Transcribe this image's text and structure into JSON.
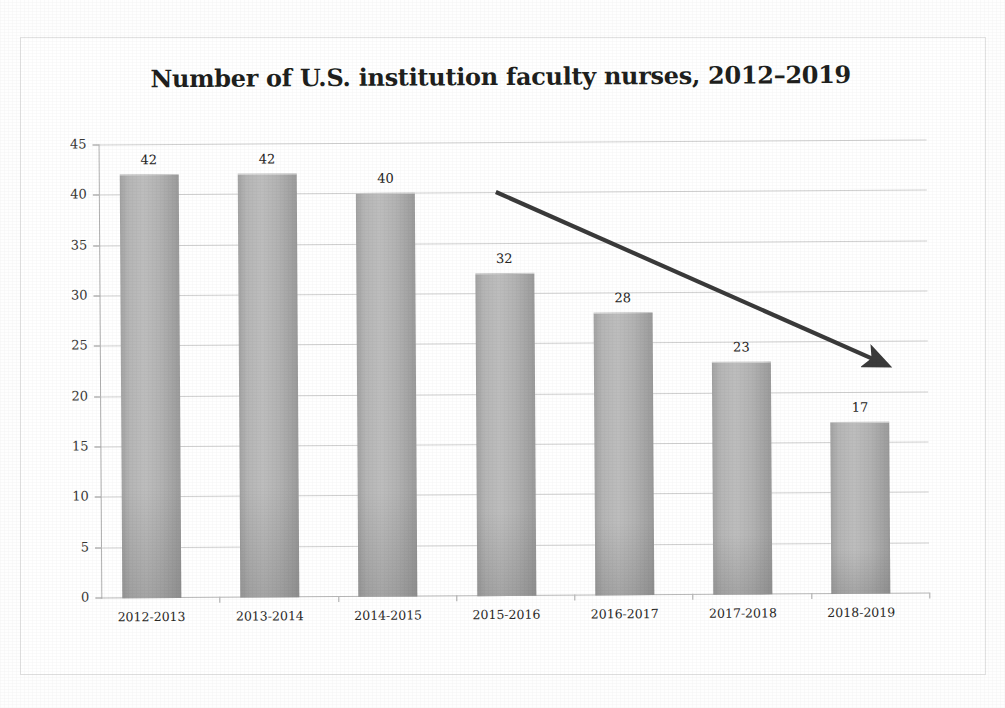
{
  "chart_data": {
    "type": "bar",
    "title": "Number of U.S. institution faculty nurses, 2012–2019",
    "categories": [
      "2012-2013",
      "2013-2014",
      "2014-2015",
      "2015-2016",
      "2016-2017",
      "2017-2018",
      "2018-2019"
    ],
    "values": [
      42,
      42,
      40,
      32,
      28,
      23,
      17
    ],
    "data_labels": [
      "42",
      "42",
      "40",
      "32",
      "28",
      "23",
      "17"
    ],
    "xlabel": "",
    "ylabel": "",
    "ylim": [
      0,
      45
    ],
    "ytick_labels": [
      "0",
      "5",
      "10",
      "15",
      "20",
      "25",
      "30",
      "35",
      "40",
      "45"
    ],
    "ytick_values": [
      0,
      5,
      10,
      15,
      20,
      25,
      30,
      35,
      40,
      45
    ],
    "grid": true,
    "grid_axis": "y",
    "legend": false,
    "legend_position": "none",
    "annotations": [
      {
        "kind": "arrow",
        "name": "declining-trend-arrow",
        "label": "",
        "from": [
          497,
          192
        ],
        "to": [
          897,
          372
        ]
      }
    ],
    "colors": {
      "bar_fill_light": "#bdbdbd",
      "bar_fill_dark": "#9b9b9b",
      "gridline": "#d0d0d0",
      "axis": "#b0b0b0",
      "text": "#262523",
      "arrow": "#3a3a3a",
      "background": "#ffffff",
      "frame": "#e2e2e2"
    }
  }
}
